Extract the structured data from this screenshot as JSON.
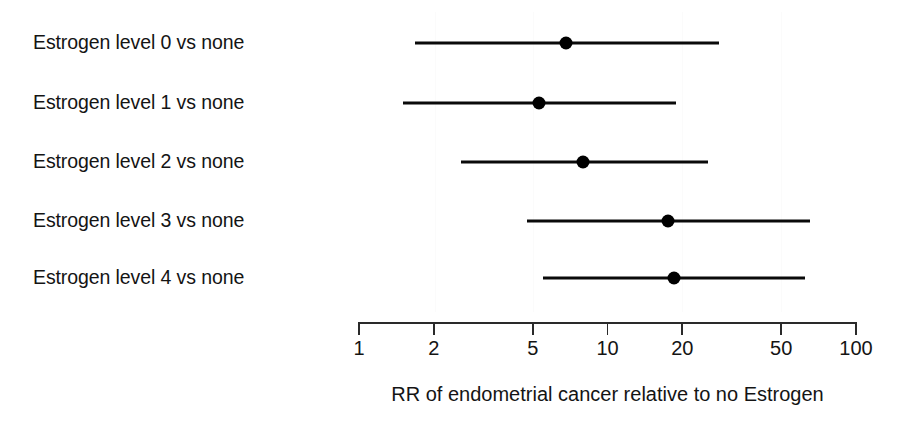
{
  "chart_data": {
    "type": "scatter",
    "subtype": "forest-plot",
    "title": "",
    "xlabel": "RR of endometrial cancer relative to no Estrogen",
    "ylabel": "",
    "xscale": "log",
    "xlim": [
      1,
      100
    ],
    "xticks": [
      1,
      2,
      5,
      10,
      20,
      50,
      100
    ],
    "xtick_labels": [
      "1",
      "2",
      "5",
      "10",
      "20",
      "50",
      "100"
    ],
    "grid": false,
    "legend": null,
    "categories": [
      "Estrogen level 0 vs none",
      "Estrogen level 1 vs none",
      "Estrogen level 2 vs none",
      "Estrogen level 3 vs none",
      "Estrogen level 4 vs none"
    ],
    "values": [
      6.8,
      5.3,
      8.0,
      17.5,
      18.5
    ],
    "ci_low": [
      1.68,
      1.5,
      2.57,
      4.74,
      5.5
    ],
    "ci_high": [
      28.1,
      18.9,
      25.4,
      65.3,
      62.4
    ],
    "rows": [
      {
        "label": "Estrogen level 0 vs none",
        "rr": 6.8,
        "ci_low": 1.68,
        "ci_high": 28.1
      },
      {
        "label": "Estrogen level 1 vs none",
        "rr": 5.3,
        "ci_low": 1.5,
        "ci_high": 18.9
      },
      {
        "label": "Estrogen level 2 vs none",
        "rr": 8.0,
        "ci_low": 2.57,
        "ci_high": 25.4
      },
      {
        "label": "Estrogen level 3 vs none",
        "rr": 17.5,
        "ci_low": 4.74,
        "ci_high": 65.3
      },
      {
        "label": "Estrogen level 4 vs none",
        "rr": 18.5,
        "ci_low": 5.5,
        "ci_high": 62.4
      }
    ],
    "marker_color": "#000000",
    "line_color": "#0a0a0a",
    "background_color": "#ffffff"
  },
  "axis": {
    "caption": "RR of endometrial cancer relative to no Estrogen"
  },
  "layout": {
    "x_at_value_1": 359,
    "x_at_value_100": 856,
    "px_per_decade": 248.5,
    "axis_y": 322,
    "row_y": [
      43,
      103,
      162,
      221,
      278
    ],
    "caption_y": 384,
    "tick_label_y": 338,
    "gridline_x": [
      435,
      533,
      682,
      781
    ]
  }
}
